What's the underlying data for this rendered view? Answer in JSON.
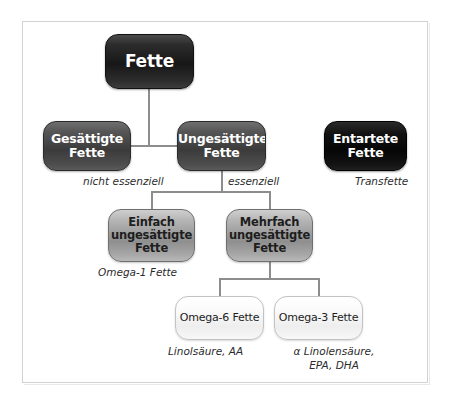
{
  "diagram": {
    "title": "Fette",
    "nodes": {
      "root": {
        "label": "Fette"
      },
      "saturated": {
        "label": "Gesättigte\nFette",
        "line1": "Gesättigte",
        "line2": "Fette"
      },
      "unsaturated": {
        "label": "Ungesättigte\nFette",
        "line1": "Ungesättigte",
        "line2": "Fette"
      },
      "degenerate": {
        "label": "Entartete\nFette",
        "line1": "Entartete",
        "line2": "Fette"
      },
      "mono": {
        "line1": "Einfach",
        "line2": "ungesättigte",
        "line3": "Fette"
      },
      "poly": {
        "line1": "Mehrfach",
        "line2": "ungesättigte",
        "line3": "Fette"
      },
      "omega6": {
        "label": "Omega-6 Fette"
      },
      "omega3": {
        "label": "Omega-3 Fette"
      }
    },
    "captions": {
      "saturated": "nicht essenziell",
      "unsaturated": "essenziell",
      "degenerate": "Transfette",
      "mono": "Omega-1 Fette",
      "omega6": "Linolsäure, AA",
      "omega3_line1": "α Linolensäure,",
      "omega3_line2": "EPA, DHA"
    },
    "colors": {
      "background": "#ffffff",
      "frame_border": "#d2d2d2",
      "connector": "#8d8d8d",
      "root_fill": "#171717",
      "level2_fill": "#3b3b3b",
      "black_fill": "#060606",
      "level3_fill": "#8f8f8f",
      "level4_fill": "#f7f7f7",
      "light_text": "#ffffff",
      "dark_text": "#1d1d1d",
      "caption_text": "#2b2b2b"
    }
  }
}
